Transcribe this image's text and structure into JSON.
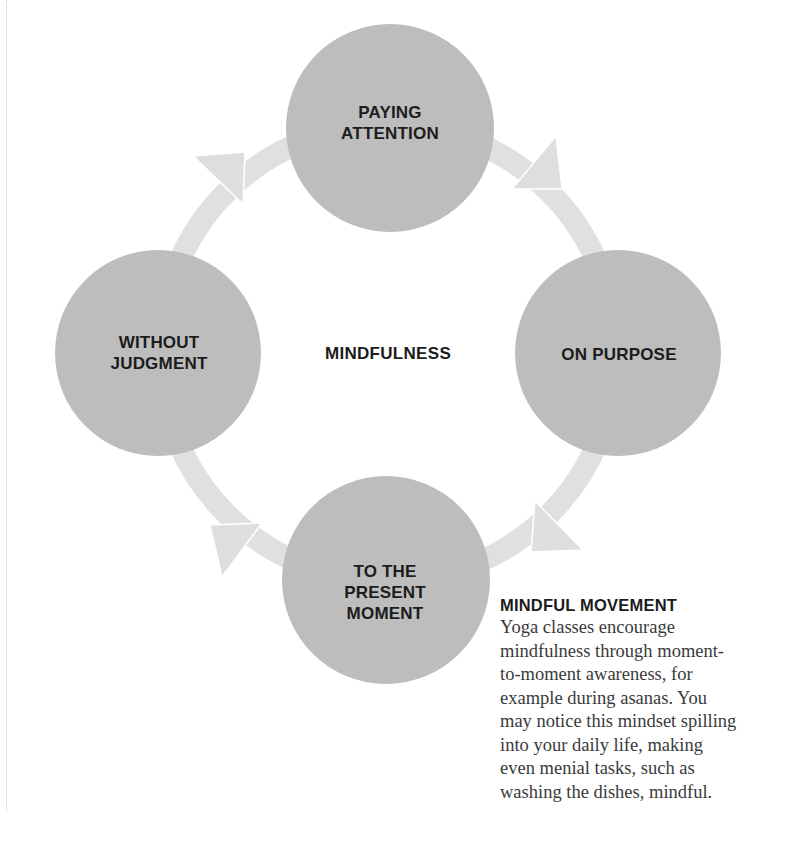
{
  "diagram": {
    "center_label": "MINDFULNESS",
    "nodes": [
      {
        "id": "top",
        "label": "PAYING\nATTENTION",
        "cx": 390,
        "cy": 128,
        "r": 104
      },
      {
        "id": "right",
        "label": "ON PURPOSE",
        "cx": 618,
        "cy": 353,
        "r": 103
      },
      {
        "id": "bottom",
        "label": "TO THE\nPRESENT\nMOMENT",
        "cx": 386,
        "cy": 580,
        "r": 104
      },
      {
        "id": "left",
        "label": "WITHOUT\nJUDGMENT",
        "cx": 158,
        "cy": 353,
        "r": 103
      }
    ],
    "cycle_direction": "clockwise",
    "colors": {
      "node_fill": "#bdbdbd",
      "ring": "#e0e0e0",
      "text": "#1c1c1c"
    }
  },
  "sidebar": {
    "title": "MINDFUL MOVEMENT",
    "body": "Yoga classes encourage\nmindfulness through moment-\nto-moment awareness, for\nexample during asanas. You\nmay notice this mindset spilling\ninto your daily life, making\neven menial tasks, such as\nwashing the dishes, mindful."
  }
}
